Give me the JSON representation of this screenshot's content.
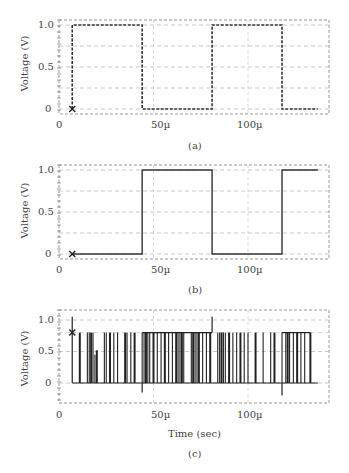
{
  "chart_data": [
    {
      "type": "line",
      "panel": "(a)",
      "style": "dashed",
      "ylabel": "Voltage (V)",
      "xlabel": "",
      "x_ticks": [
        "0",
        "50µ",
        "100µ"
      ],
      "y_ticks": [
        "0",
        "0.5",
        "1.0"
      ],
      "xlim": [
        0,
        145
      ],
      "ylim": [
        -0.05,
        1.05
      ],
      "grid": true,
      "marker": {
        "symbol": "x",
        "t": 7,
        "v": 0
      },
      "x": [
        7,
        7,
        44,
        44,
        81,
        81,
        118,
        118,
        137
      ],
      "values": [
        0,
        1,
        1,
        0,
        0,
        1,
        1,
        0,
        0
      ]
    },
    {
      "type": "line",
      "panel": "(b)",
      "style": "solid",
      "ylabel": "Voltage (V)",
      "xlabel": "",
      "x_ticks": [
        "0",
        "50µ",
        "100µ"
      ],
      "y_ticks": [
        "0",
        "0.5",
        "1.0"
      ],
      "xlim": [
        0,
        145
      ],
      "ylim": [
        -0.05,
        1.05
      ],
      "grid": true,
      "marker": {
        "symbol": "x",
        "t": 7,
        "v": 0
      },
      "x": [
        7,
        44,
        44,
        81,
        81,
        118,
        118,
        137
      ],
      "values": [
        0,
        0,
        1,
        1,
        0,
        0,
        1,
        1
      ]
    },
    {
      "type": "line",
      "panel": "(c)",
      "style": "solid",
      "ylabel": "Voltage (V)",
      "xlabel": "Time (sec)",
      "x_ticks": [
        "0",
        "50µ",
        "100µ"
      ],
      "y_ticks": [
        "0",
        "0.5",
        "1.0"
      ],
      "xlim": [
        0,
        145
      ],
      "ylim": [
        -0.3,
        1.1
      ],
      "grid": true,
      "marker": {
        "symbol": "x",
        "t": 7,
        "v": 0.8
      },
      "description": "Noisy pulse train oscillating between 0 and ~0.8 V with spikes near t=7µ (1.05 V), t=44µ (-0.15 V), t=81µ (1.05 V), t=118µ (-0.2 V)",
      "pulse_times": [
        11,
        15,
        16,
        17,
        18,
        19,
        20,
        24,
        25,
        27,
        29,
        31,
        35,
        36,
        38,
        40,
        44,
        45,
        46,
        47,
        48,
        50,
        52,
        54,
        56,
        58,
        60,
        62,
        63,
        64,
        65,
        66,
        70,
        71,
        72,
        73,
        74,
        76,
        78,
        80,
        84,
        85,
        86,
        87,
        88,
        90,
        92,
        94,
        96,
        98,
        100,
        104,
        108,
        112,
        114,
        118,
        120,
        121,
        122,
        124,
        126,
        128,
        130,
        133
      ],
      "high_level": 0.8,
      "low_level": 0
    }
  ],
  "captions": {
    "a": "(a)",
    "b": "(b)",
    "c": "(c)"
  },
  "axis": {
    "ylabel": "Voltage (V)",
    "xlabel": "Time (sec)",
    "x0": "0",
    "x50": "50µ",
    "x100": "100µ",
    "y0": "0",
    "y05": "0.5",
    "y10": "1.0"
  }
}
